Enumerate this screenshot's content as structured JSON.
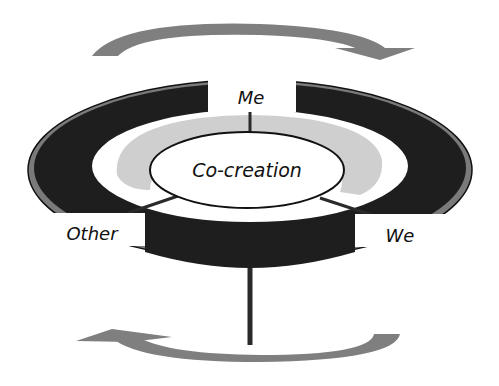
{
  "diagram": {
    "center_label": "Co-creation",
    "labels": {
      "top": "Me",
      "left": "Other",
      "right": "We"
    },
    "arrows": {
      "top": "clockwise",
      "bottom": "counter-clockwise"
    },
    "colors": {
      "ring_dark": "#1e1e1e",
      "ring_edge": "#7a7a7a",
      "inner_band": "#cfcfcf",
      "arrow": "#7f7f7f",
      "line": "#2a2a2a",
      "background": "#ffffff"
    }
  }
}
